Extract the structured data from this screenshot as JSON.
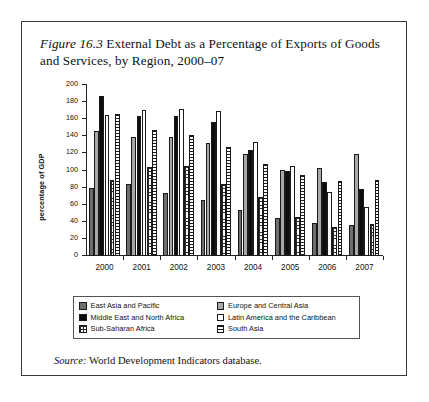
{
  "figure": {
    "number": "Figure 16.3",
    "title": "External Debt as a Percentage of Exports of Goods and Services, by Region, 2000–07",
    "source_label": "Source:",
    "source_text": "World Development Indicators database."
  },
  "legend": {
    "entries": [
      {
        "key": "eap",
        "label": "East Asia and Pacific",
        "swatch": "solid-dark-gray"
      },
      {
        "key": "eca",
        "label": "Europe and Central Asia",
        "swatch": "solid-light-gray"
      },
      {
        "key": "mena",
        "label": "Middle East and North Africa",
        "swatch": "solid-black"
      },
      {
        "key": "lac",
        "label": "Latin America and the Caribbean",
        "swatch": "solid-white"
      },
      {
        "key": "ssa",
        "label": "Sub-Saharan Africa",
        "swatch": "cross-hatch"
      },
      {
        "key": "sa",
        "label": "South Asia",
        "swatch": "horizontal-lines"
      }
    ]
  },
  "chart_data": {
    "type": "bar",
    "title": "External Debt as a Percentage of Exports of Goods and Services, by Region, 2000–07",
    "xlabel": "",
    "ylabel": "percentage of GDP",
    "ylim": [
      0,
      200
    ],
    "ytick_step": 20,
    "yticks": [
      0,
      20,
      40,
      60,
      80,
      100,
      120,
      140,
      160,
      180,
      200
    ],
    "ytick_labels": [
      "0",
      "20",
      "40",
      "60",
      "80",
      "100",
      "120",
      "140",
      "160",
      "180",
      "200"
    ],
    "grid": false,
    "legend_position": "bottom",
    "categories": [
      "2000",
      "2001",
      "2002",
      "2003",
      "2004",
      "2005",
      "2006",
      "2007"
    ],
    "series": [
      {
        "name": "East Asia and Pacific",
        "values": [
          80,
          84,
          74,
          65,
          54,
          45,
          39,
          36
        ]
      },
      {
        "name": "Europe and Central Asia",
        "values": [
          146,
          139,
          139,
          132,
          119,
          101,
          103,
          119
        ]
      },
      {
        "name": "Middle East and North Africa",
        "values": [
          187,
          164,
          164,
          157,
          124,
          99,
          86,
          78
        ]
      },
      {
        "name": "Latin America and the Caribbean",
        "values": [
          165,
          171,
          172,
          170,
          133,
          105,
          75,
          57
        ]
      },
      {
        "name": "Sub-Saharan Africa",
        "values": [
          89,
          104,
          105,
          84,
          69,
          46,
          34,
          37
        ]
      },
      {
        "name": "South Asia",
        "values": [
          166,
          147,
          141,
          127,
          108,
          95,
          88,
          89
        ]
      }
    ]
  }
}
